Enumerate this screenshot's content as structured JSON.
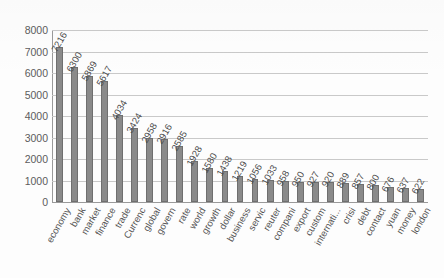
{
  "chart_data": {
    "type": "bar",
    "title": "",
    "xlabel": "",
    "ylabel": "",
    "ylim": [
      0,
      8000
    ],
    "ytick_step": 1000,
    "yticks": [
      8000,
      7000,
      6000,
      5000,
      4000,
      3000,
      2000,
      1000,
      0
    ],
    "grid": true,
    "legend": "none",
    "bar_color": "#8a8a8a",
    "bar_edge_color": "#6f6f6f",
    "gridline_color": "#c9c9c9",
    "axis_color": "#9a9a9a",
    "label_rotation_degrees": 60,
    "categories": [
      "economy",
      "bank",
      "market",
      "finance",
      "trade",
      "Currenc",
      "global",
      "govern",
      "rate",
      "world",
      "growth",
      "dollar",
      "business",
      "servic",
      "reuter",
      "compani",
      "export",
      "custom",
      "internati...",
      "crisi",
      "debt",
      "contact",
      "yuan",
      "money",
      "london"
    ],
    "values": [
      7216,
      6300,
      5869,
      5617,
      4034,
      3424,
      2958,
      2916,
      2585,
      1928,
      1580,
      1438,
      1219,
      1056,
      1033,
      958,
      950,
      927,
      920,
      889,
      857,
      800,
      676,
      637,
      622
    ],
    "value_labels": [
      "7216",
      "6300",
      "5869",
      "5617",
      "4034",
      "3424",
      "2958",
      "2916",
      "2585",
      "1928",
      "1580",
      "1438",
      "1219",
      "1056",
      "1033",
      "958",
      "950",
      "927",
      "920",
      "889",
      "857",
      "800",
      "676",
      "637",
      "622"
    ]
  }
}
